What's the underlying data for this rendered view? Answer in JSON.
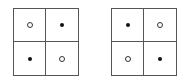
{
  "diagrams": [
    {
      "name": "left-grid",
      "cells": [
        "hollow",
        "filled",
        "filled",
        "hollow"
      ]
    },
    {
      "name": "right-grid",
      "cells": [
        "filled",
        "hollow",
        "hollow",
        "filled"
      ]
    }
  ],
  "legend": {
    "filled": "filled-dot",
    "hollow": "hollow-circle"
  },
  "colors": {
    "border": "#555555",
    "dot": "#111111",
    "background": "#ffffff"
  }
}
